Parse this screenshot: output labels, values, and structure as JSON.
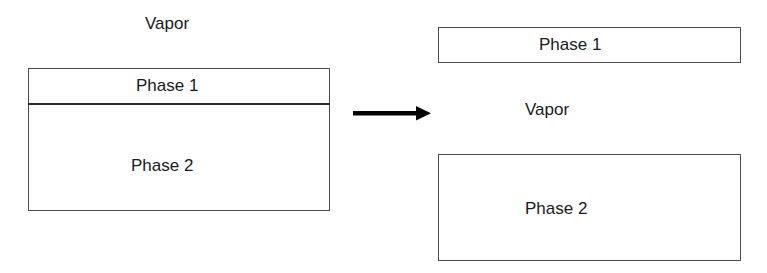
{
  "diagram": {
    "left": {
      "vapor_label": "Vapor",
      "phase1_label": "Phase 1",
      "phase2_label": "Phase 2"
    },
    "arrow": {
      "direction": "right",
      "icon": "arrow-right-icon"
    },
    "right": {
      "phase1_label": "Phase 1",
      "vapor_label": "Vapor",
      "phase2_label": "Phase 2"
    },
    "colors": {
      "stroke": "#4a4a4a",
      "text": "#1a1a1a",
      "arrow": "#000000",
      "background": "#ffffff"
    }
  }
}
